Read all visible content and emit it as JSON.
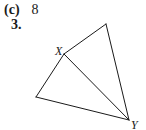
{
  "answer": {
    "label": "(c)",
    "value": "8"
  },
  "problem": {
    "number": "3."
  },
  "figure": {
    "type": "geometry-diagram",
    "stroke_color": "#1a1a1a",
    "vertices": {
      "top": {
        "x": 106,
        "y": 24
      },
      "X": {
        "x": 64,
        "y": 54,
        "label": "X"
      },
      "left": {
        "x": 36,
        "y": 97
      },
      "Y": {
        "x": 129,
        "y": 120,
        "label": "Y"
      }
    },
    "labels": {
      "X": "X",
      "Y": "Y"
    }
  }
}
